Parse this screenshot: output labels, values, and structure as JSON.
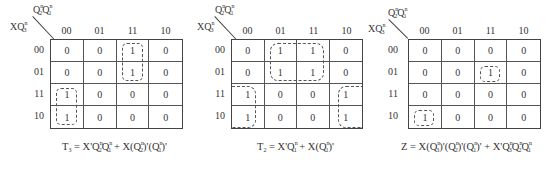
{
  "maps": [
    {
      "id": "T3",
      "corner": {
        "col_var": "Q2nQ1n",
        "row_var": "XQ3n"
      },
      "col_headers": [
        "00",
        "01",
        "11",
        "10"
      ],
      "row_headers": [
        "00",
        "01",
        "11",
        "10"
      ],
      "cells": [
        [
          "0",
          "0",
          "1",
          "0"
        ],
        [
          "0",
          "0",
          "1",
          "0"
        ],
        [
          "1",
          "0",
          "0",
          "0"
        ],
        [
          "1",
          "0",
          "0",
          "0"
        ]
      ],
      "groups": [
        {
          "rows": [
            0,
            1
          ],
          "cols": [
            2
          ],
          "style": "closed"
        },
        {
          "rows": [
            2,
            3
          ],
          "cols": [
            0
          ],
          "style": "closed"
        }
      ],
      "formula": "T3 = X'Q2nQ1n + X(Q2n)'(Q1n)'"
    },
    {
      "id": "T2",
      "corner": {
        "col_var": "Q2nQ1n",
        "row_var": "XQ3n"
      },
      "col_headers": [
        "00",
        "01",
        "11",
        "10"
      ],
      "row_headers": [
        "00",
        "01",
        "11",
        "10"
      ],
      "cells": [
        [
          "0",
          "1",
          "1",
          "0"
        ],
        [
          "0",
          "1",
          "1",
          "0"
        ],
        [
          "1",
          "0",
          "0",
          "1"
        ],
        [
          "1",
          "0",
          "0",
          "1"
        ]
      ],
      "groups": [
        {
          "rows": [
            0,
            1
          ],
          "cols": [
            1,
            2
          ],
          "style": "closed"
        },
        {
          "rows": [
            2,
            3
          ],
          "cols": [
            0,
            3
          ],
          "style": "wrap-around"
        }
      ],
      "formula": "T2 = X'Q1n + X(Q1n)'"
    },
    {
      "id": "Z",
      "corner": {
        "col_var": "Q2nQ1n",
        "row_var": "XQ3n"
      },
      "col_headers": [
        "00",
        "01",
        "11",
        "10"
      ],
      "row_headers": [
        "00",
        "01",
        "11",
        "10"
      ],
      "cells": [
        [
          "0",
          "0",
          "0",
          "0"
        ],
        [
          "0",
          "0",
          "1",
          "0"
        ],
        [
          "0",
          "0",
          "0",
          "0"
        ],
        [
          "1",
          "0",
          "0",
          "0"
        ]
      ],
      "groups": [
        {
          "rows": [
            1
          ],
          "cols": [
            2
          ],
          "style": "closed"
        },
        {
          "rows": [
            3
          ],
          "cols": [
            0
          ],
          "style": "closed"
        }
      ],
      "formula": "Z = X(Q3n)'(Q2n)'(Q1n)' + X'Q3nQ2nQ1n"
    }
  ],
  "labels": {
    "Q": "Q",
    "X": "X",
    "n": "n",
    "one": "1",
    "two": "2",
    "three": "3",
    "T": "T",
    "Z": "Z",
    "eq": " = ",
    "plus": " + ",
    "prime": "'",
    "lp": "(",
    "rp": ")"
  }
}
